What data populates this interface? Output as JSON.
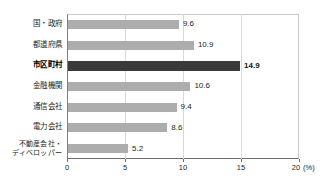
{
  "chart_data": {
    "type": "bar",
    "orientation": "horizontal",
    "title": "",
    "subtitle": "",
    "xlabel": "(%)",
    "ylabel": "",
    "xlim": [
      0,
      20
    ],
    "xticks": [
      "0",
      "5",
      "10",
      "15",
      "20"
    ],
    "unit_label": "(%)",
    "grid": "vertical",
    "legend": "none",
    "highlight_category": "市区町村",
    "colors": {
      "bar": "#adadad",
      "bar_highlight": "#3a3a3a",
      "gridline": "#d8d8d8",
      "axis": "#6e6e6e",
      "text": "#231f20"
    },
    "categories": [
      "国・政府",
      "都道府県",
      "市区町村",
      "金融機関",
      "通信会社",
      "電力会社",
      "不動産会社・\nディベロッパー"
    ],
    "values": [
      9.6,
      10.9,
      14.9,
      10.6,
      9.4,
      8.6,
      5.2
    ],
    "value_labels": [
      "9.6",
      "10.9",
      "14.9",
      "10.6",
      "9.4",
      "8.6",
      "5.2"
    ],
    "highlighted": [
      false,
      false,
      true,
      false,
      false,
      false,
      false
    ]
  }
}
